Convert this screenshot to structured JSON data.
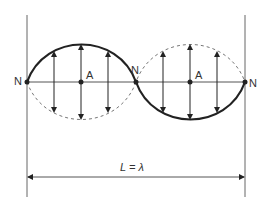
{
  "diagram": {
    "node_label": "N",
    "antinode_label": "A",
    "dimension_label": "L = λ",
    "colors": {
      "line": "#555555",
      "curve": "#222222",
      "dashed": "#777777",
      "text": "#333333"
    },
    "nodes": [
      {
        "label": "N",
        "x": 27,
        "y": 82
      },
      {
        "label": "N",
        "x": 136,
        "y": 82
      },
      {
        "label": "N",
        "x": 245,
        "y": 82
      }
    ],
    "antinodes": [
      {
        "label": "A",
        "x": 81,
        "y": 82
      },
      {
        "label": "A",
        "x": 190,
        "y": 82
      }
    ]
  }
}
